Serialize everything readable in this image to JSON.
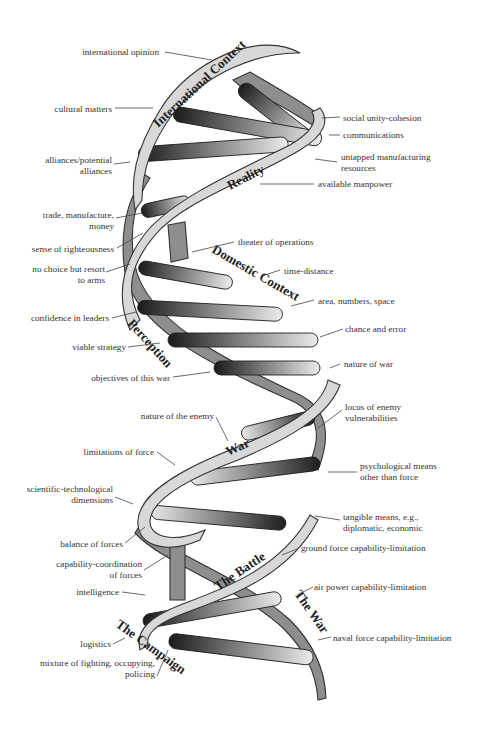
{
  "diagram": {
    "bands": {
      "international_context": "International Context",
      "reality": "Reality",
      "domestic_context": "Domestic Context",
      "perception": "Perception",
      "war": "War",
      "the_battle": "The Battle",
      "the_war": "The War",
      "the_campaign": "The Campaign"
    },
    "left_labels": [
      {
        "lines": [
          "international opinion"
        ]
      },
      {
        "lines": [
          "cultural matters"
        ]
      },
      {
        "lines": [
          "alliances/potential",
          "alliances"
        ]
      },
      {
        "lines": [
          "trade, manufacture,",
          "money"
        ]
      },
      {
        "lines": [
          "sense of righteousness"
        ]
      },
      {
        "lines": [
          "no choice but resort",
          "to arms"
        ]
      },
      {
        "lines": [
          "confidence in leaders"
        ]
      },
      {
        "lines": [
          "viable strategy"
        ]
      },
      {
        "lines": [
          "objectives of this war"
        ]
      },
      {
        "lines": [
          "nature of the enemy"
        ]
      },
      {
        "lines": [
          "limitations of force"
        ]
      },
      {
        "lines": [
          "scientific-technological",
          "dimensions"
        ]
      },
      {
        "lines": [
          "balance of forces"
        ]
      },
      {
        "lines": [
          "capability-coordination",
          "of forces"
        ]
      },
      {
        "lines": [
          "intelligence"
        ]
      },
      {
        "lines": [
          "logistics"
        ]
      },
      {
        "lines": [
          "mixture of fighting, occupying,",
          "policing"
        ]
      }
    ],
    "right_labels": [
      {
        "lines": [
          "social unity-cohesion"
        ]
      },
      {
        "lines": [
          "communications"
        ]
      },
      {
        "lines": [
          "untapped manufacturing",
          "resources"
        ]
      },
      {
        "lines": [
          "available manpower"
        ]
      },
      {
        "lines": [
          "theater of operations"
        ]
      },
      {
        "lines": [
          "time-distance"
        ]
      },
      {
        "lines": [
          "area, numbers, space"
        ]
      },
      {
        "lines": [
          "chance and error"
        ]
      },
      {
        "lines": [
          "nature of war"
        ]
      },
      {
        "lines": [
          "locus of enemy",
          "vulnerabilities"
        ]
      },
      {
        "lines": [
          "psychological means",
          "other than force"
        ]
      },
      {
        "lines": [
          "tangible means, e.g.,",
          "diplomatic, economic"
        ]
      },
      {
        "lines": [
          "ground force capability-limitation"
        ]
      },
      {
        "lines": [
          "air power capability-limitation"
        ]
      },
      {
        "lines": [
          "naval force capability-limitation"
        ]
      }
    ],
    "colors": {
      "ribbon_front": "#d8d8d8",
      "ribbon_back": "#8e8e8e",
      "rung_dark": "#1e1e1e",
      "rung_light": "#e6e6e6",
      "text": "#333333"
    }
  }
}
